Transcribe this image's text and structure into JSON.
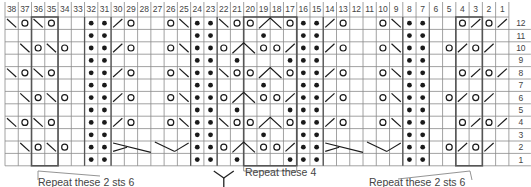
{
  "chart": {
    "columns": 38,
    "rows": 12,
    "column_labels": [
      "38",
      "37",
      "36",
      "35",
      "34",
      "33",
      "32",
      "31",
      "30",
      "29",
      "28",
      "27",
      "26",
      "25",
      "24",
      "23",
      "22",
      "21",
      "20",
      "19",
      "18",
      "17",
      "16",
      "15",
      "14",
      "13",
      "12",
      "11",
      "10",
      "9",
      "8",
      "7",
      "6",
      "5",
      "4",
      "3",
      "2",
      "1"
    ],
    "row_labels": [
      "12",
      "11",
      "10",
      "9",
      "8",
      "7",
      "6",
      "5",
      "4",
      "3",
      "2",
      "1"
    ],
    "legend_key": {
      "k": "knit (blank)",
      "p": "purl (dot)",
      "o": "yarn over (circle)",
      "\\": "ssk (left slant)",
      "/": "k2tog (right slant)",
      "^": "centered double decrease (spans 2 cells)",
      "C": "cable crossing"
    },
    "grid": {
      "12": [
        "\\",
        "o",
        "\\",
        "o",
        "k",
        "k",
        "p",
        "p",
        "/",
        "o",
        "k",
        "k",
        "o",
        "\\",
        "p",
        "p",
        "\\",
        "o",
        "o",
        "^",
        "^",
        "o",
        "p",
        "p",
        "/",
        "o",
        "k",
        "k",
        "o",
        "\\",
        "p",
        "p",
        "k",
        "k",
        "o",
        "/",
        "o",
        "/"
      ],
      "11": [
        "k",
        "k",
        "k",
        "k",
        "k",
        "k",
        "p",
        "p",
        "k",
        "k",
        "k",
        "k",
        "k",
        "k",
        "p",
        "p",
        "k",
        "k",
        "k",
        "p",
        "k",
        "k",
        "p",
        "p",
        "k",
        "k",
        "k",
        "k",
        "k",
        "k",
        "p",
        "p",
        "k",
        "k",
        "k",
        "k",
        "k",
        "k"
      ],
      "10": [
        "k",
        "\\",
        "o",
        "\\",
        "o",
        "k",
        "p",
        "p",
        "/",
        "o",
        "k",
        "k",
        "o",
        "\\",
        "p",
        "p",
        "o",
        "^",
        "^",
        "o",
        "o",
        "/",
        "p",
        "p",
        "/",
        "o",
        "k",
        "k",
        "o",
        "\\",
        "p",
        "p",
        "k",
        "o",
        "/",
        "o",
        "/",
        "k"
      ],
      "9": [
        "k",
        "k",
        "k",
        "k",
        "k",
        "k",
        "p",
        "p",
        "k",
        "k",
        "k",
        "k",
        "k",
        "k",
        "p",
        "p",
        "k",
        "p",
        "k",
        "k",
        "k",
        "p",
        "p",
        "p",
        "k",
        "k",
        "k",
        "k",
        "k",
        "k",
        "p",
        "p",
        "k",
        "k",
        "k",
        "k",
        "k",
        "k"
      ],
      "8": [
        "\\",
        "o",
        "\\",
        "o",
        "k",
        "k",
        "p",
        "p",
        "/",
        "o",
        "k",
        "k",
        "o",
        "\\",
        "p",
        "p",
        "\\",
        "o",
        "o",
        "^",
        "^",
        "o",
        "p",
        "p",
        "/",
        "o",
        "k",
        "k",
        "o",
        "\\",
        "p",
        "p",
        "k",
        "k",
        "o",
        "/",
        "o",
        "/"
      ],
      "7": [
        "k",
        "k",
        "k",
        "k",
        "k",
        "k",
        "p",
        "p",
        "k",
        "k",
        "k",
        "k",
        "k",
        "k",
        "p",
        "p",
        "k",
        "k",
        "k",
        "p",
        "k",
        "k",
        "p",
        "p",
        "k",
        "k",
        "k",
        "k",
        "k",
        "k",
        "p",
        "p",
        "k",
        "k",
        "k",
        "k",
        "k",
        "k"
      ],
      "6": [
        "k",
        "\\",
        "o",
        "\\",
        "o",
        "k",
        "p",
        "p",
        "/",
        "o",
        "k",
        "k",
        "o",
        "\\",
        "p",
        "p",
        "o",
        "^",
        "^",
        "o",
        "o",
        "/",
        "p",
        "p",
        "/",
        "o",
        "k",
        "k",
        "o",
        "\\",
        "p",
        "p",
        "k",
        "o",
        "/",
        "o",
        "/",
        "k"
      ],
      "5": [
        "k",
        "k",
        "k",
        "k",
        "k",
        "k",
        "p",
        "p",
        "k",
        "k",
        "k",
        "k",
        "k",
        "k",
        "p",
        "p",
        "k",
        "p",
        "k",
        "k",
        "k",
        "p",
        "p",
        "p",
        "k",
        "k",
        "k",
        "k",
        "k",
        "k",
        "p",
        "p",
        "k",
        "k",
        "k",
        "k",
        "k",
        "k"
      ],
      "4": [
        "\\",
        "o",
        "\\",
        "o",
        "k",
        "k",
        "p",
        "p",
        "/",
        "o",
        "k",
        "k",
        "o",
        "\\",
        "p",
        "p",
        "\\",
        "o",
        "o",
        "^",
        "^",
        "o",
        "p",
        "p",
        "/",
        "o",
        "k",
        "k",
        "o",
        "\\",
        "p",
        "p",
        "k",
        "k",
        "o",
        "/",
        "o",
        "/"
      ],
      "3": [
        "k",
        "k",
        "k",
        "k",
        "k",
        "k",
        "p",
        "p",
        "k",
        "k",
        "k",
        "k",
        "k",
        "k",
        "p",
        "p",
        "k",
        "k",
        "k",
        "p",
        "k",
        "k",
        "p",
        "p",
        "k",
        "k",
        "k",
        "k",
        "k",
        "k",
        "p",
        "p",
        "k",
        "k",
        "k",
        "k",
        "k",
        "k"
      ],
      "2": [
        "k",
        "\\",
        "o",
        "\\",
        "o",
        "k",
        "p",
        "p",
        "C",
        "C",
        "C",
        "C",
        "C",
        "C",
        "p",
        "p",
        "o",
        "^",
        "^",
        "o",
        "o",
        "/",
        "p",
        "p",
        "C",
        "C",
        "C",
        "C",
        "C",
        "C",
        "p",
        "p",
        "k",
        "o",
        "/",
        "o",
        "/",
        "k"
      ],
      "1": [
        "k",
        "k",
        "k",
        "k",
        "k",
        "k",
        "p",
        "p",
        "k",
        "k",
        "k",
        "k",
        "k",
        "k",
        "p",
        "p",
        "k",
        "p",
        "k",
        "k",
        "k",
        "p",
        "p",
        "p",
        "k",
        "k",
        "k",
        "k",
        "k",
        "k",
        "p",
        "p",
        "k",
        "k",
        "k",
        "k",
        "k",
        "k"
      ]
    },
    "repeat_boxes": [
      {
        "from_col": 36,
        "to_col": 35,
        "rows": "1-12"
      },
      {
        "from_col": 20,
        "to_col": 17,
        "rows": "1-12"
      },
      {
        "from_col": 4,
        "to_col": 3,
        "rows": "1-12"
      }
    ],
    "cables": [
      {
        "row": 2,
        "from_col": 30,
        "to_col": 25
      },
      {
        "row": 2,
        "from_col": 14,
        "to_col": 9
      }
    ]
  },
  "captions": {
    "left": "Repeat these 2 sts 6",
    "center": "Repeat these 4",
    "right": "Repeat these 2 sts 6"
  },
  "colors": {
    "grid_line": "#8a8a8a",
    "heavy_line": "#555555",
    "symbol": "#1a1a1a",
    "label": "#444444",
    "background": "#ffffff"
  }
}
